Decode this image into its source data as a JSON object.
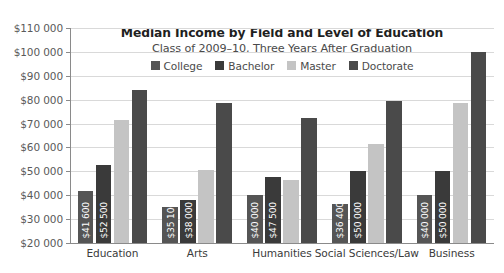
{
  "chart_data": {
    "type": "bar",
    "title": "Median Income by Field and Level of Education",
    "subtitle": "Class of 2009–10, Three Years After Graduation",
    "xlabel": "",
    "ylabel": "",
    "ylim": [
      20000,
      110000
    ],
    "ytick_step": 10000,
    "grid": true,
    "legend_position": "top-center",
    "ytick_labels": [
      "$110 000",
      "$100 000",
      "$90 000",
      "$80 000",
      "$70 000",
      "$60 000",
      "$50 000",
      "$40 000",
      "$30 000",
      "$20 000"
    ],
    "ytick_values": [
      110000,
      100000,
      90000,
      80000,
      70000,
      60000,
      50000,
      40000,
      30000,
      20000
    ],
    "categories": [
      "Education",
      "Arts",
      "Humanities",
      "Social Sciences/Law",
      "Business"
    ],
    "series": [
      {
        "name": "College",
        "color": "#555555",
        "values": [
          41600,
          35100,
          40000,
          36400,
          40000
        ],
        "labels": [
          "$41 600",
          "$35 100",
          "$40 000",
          "$36 400",
          "$40 000"
        ]
      },
      {
        "name": "Bachelor",
        "color": "#3a3a3a",
        "values": [
          52500,
          38000,
          47500,
          50000,
          50000
        ],
        "labels": [
          "$52 500",
          "$38 000",
          "$47 500",
          "$50 000",
          "$50 000"
        ]
      },
      {
        "name": "Master",
        "color": "#c4c4c4",
        "values": [
          71500,
          50500,
          46500,
          61500,
          78500
        ],
        "labels": [
          "",
          "",
          "",
          "",
          ""
        ]
      },
      {
        "name": "Doctorate",
        "color": "#4a4a4a",
        "values": [
          84000,
          78500,
          72500,
          79500,
          100000
        ],
        "labels": [
          "",
          "",
          "",
          "",
          ""
        ]
      }
    ]
  }
}
